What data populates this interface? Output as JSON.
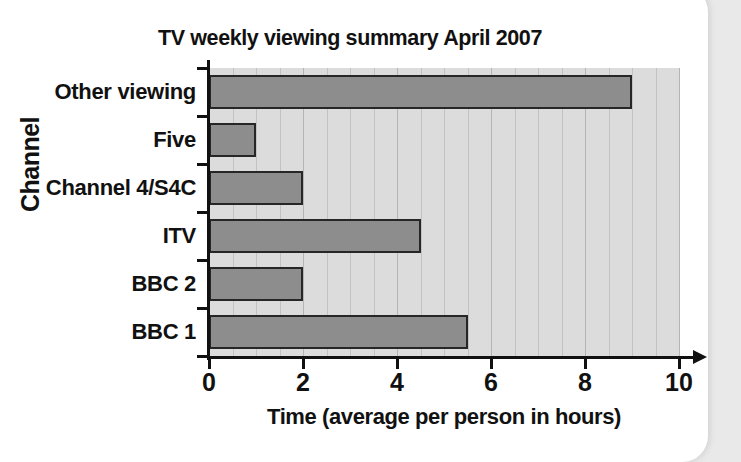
{
  "chart_data": {
    "type": "bar",
    "orientation": "horizontal",
    "title": "TV weekly viewing summary April 2007",
    "xlabel": "Time (average per person in hours)",
    "ylabel": "Channel",
    "categories": [
      "Other viewing",
      "Five",
      "Channel 4/S4C",
      "ITV",
      "BBC 2",
      "BBC 1"
    ],
    "values": [
      9.0,
      1.0,
      2.0,
      4.5,
      2.0,
      5.5
    ],
    "xlim": [
      0,
      10
    ],
    "xticks": [
      0,
      2,
      4,
      6,
      8,
      10
    ],
    "xtick_labels": [
      "0",
      "2",
      "4",
      "6",
      "8",
      "10"
    ],
    "minor_tick_step": 0.5,
    "grid": "vertical",
    "legend": "none",
    "colors": {
      "bar_fill": "#8d8d8d",
      "bar_border": "#262626",
      "plot_background": "#dcdcdc",
      "gridline": "#c2c2c2",
      "axis": "#111111",
      "page": "#ffffff",
      "canvas": "#e9e9e9"
    }
  }
}
